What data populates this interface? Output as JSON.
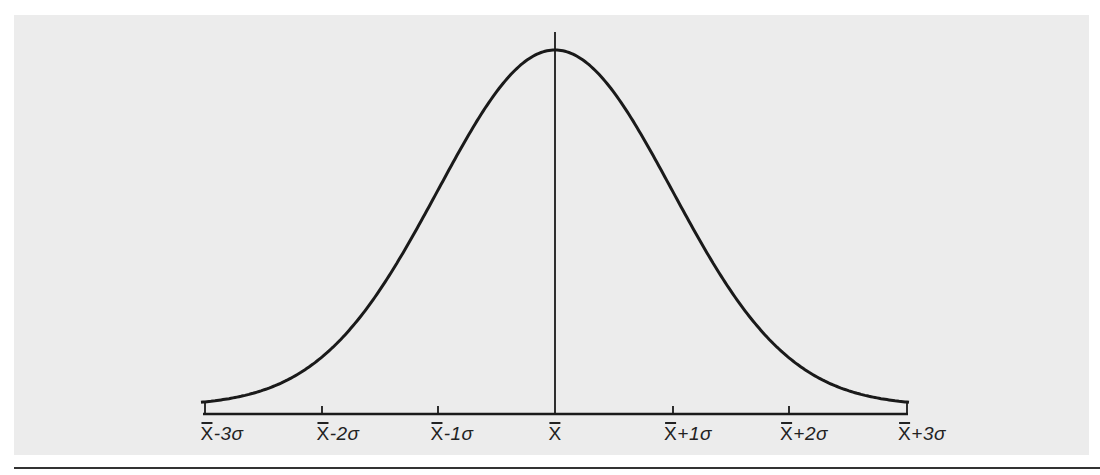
{
  "chart_data": {
    "type": "line",
    "title": "",
    "subtitle": "",
    "xlabel": "",
    "ylabel": "",
    "categories": [
      "x̄-3σ",
      "x̄-2σ",
      "x̄-1σ",
      "x̄",
      "x̄+1σ",
      "x̄+2σ",
      "x̄+3σ"
    ],
    "x": [
      -3,
      -2,
      -1,
      0,
      1,
      2,
      3
    ],
    "series": [
      {
        "name": "normal curve (relative density)",
        "values": [
          0.011,
          0.135,
          0.607,
          1.0,
          0.607,
          0.135,
          0.011
        ]
      }
    ],
    "xlim": [
      -3,
      3
    ],
    "ylim": [
      0,
      1
    ],
    "grid": false,
    "legend": "none",
    "annotations": [
      "vertical line at mean x̄"
    ]
  },
  "axis": {
    "ticks": [
      {
        "base": "X",
        "suffix": "-3σ",
        "px": 205
      },
      {
        "base": "X",
        "suffix": "-2σ",
        "px": 322
      },
      {
        "base": "X",
        "suffix": "-1σ",
        "px": 438
      },
      {
        "base": "X",
        "suffix": "",
        "px": 555
      },
      {
        "base": "X",
        "suffix": "+1σ",
        "px": 673
      },
      {
        "base": "X",
        "suffix": "+2σ",
        "px": 789
      },
      {
        "base": "X",
        "suffix": "+3σ",
        "px": 907
      }
    ]
  },
  "colors": {
    "background": "#ececec",
    "line": "#1a1a1a"
  }
}
